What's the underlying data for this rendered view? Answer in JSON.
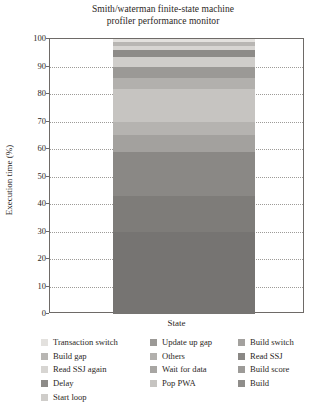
{
  "chart_data": {
    "type": "bar",
    "subtype": "stacked-bar-single-category",
    "title": "Smith/waterman finite-state machine profiler performance monitor",
    "title_lines": [
      "Smith/waterman finite-state machine",
      "profiler performance monitor"
    ],
    "xlabel": "State",
    "ylabel": "Execution time (%)",
    "categories": [
      "State"
    ],
    "ylim": [
      0,
      100
    ],
    "yticks": [
      0,
      10,
      20,
      30,
      40,
      50,
      60,
      70,
      80,
      90,
      100
    ],
    "ytick_labels": [
      "0",
      "10",
      "20",
      "30",
      "40",
      "50",
      "60",
      "70",
      "80",
      "90",
      "100"
    ],
    "grid": "horizontal-dotted",
    "legend_position": "below",
    "legend_columns": 3,
    "stack_order": "top-to-bottom",
    "series": [
      {
        "name": "Transaction switch",
        "value": 1.0,
        "color": "#e3e1de"
      },
      {
        "name": "Build gap",
        "value": 1.5,
        "color": "#b8b6b3"
      },
      {
        "name": "Read SSJ again",
        "value": 1.5,
        "color": "#d7d5d2"
      },
      {
        "name": "Delay",
        "value": 2.5,
        "color": "#8d8b88"
      },
      {
        "name": "Start loop",
        "value": 3.5,
        "color": "#cfcdca"
      },
      {
        "name": "Update up gap",
        "value": 4.0,
        "color": "#9b9996"
      },
      {
        "name": "Others",
        "value": 4.0,
        "color": "#b2b0ad"
      },
      {
        "name": "Wait for data",
        "value": 12.0,
        "color": "#c6c4c1"
      },
      {
        "name": "Pop PWA",
        "value": 5.0,
        "color": "#b5b3b0"
      },
      {
        "name": "Build switch",
        "value": 6.0,
        "color": "#a3a19e"
      },
      {
        "name": "Read SSJ",
        "value": 16.0,
        "color": "#8a8885"
      },
      {
        "name": "Build score",
        "value": 13.0,
        "color": "#7e7c79"
      },
      {
        "name": "Build",
        "value": 30.0,
        "color": "#767472"
      }
    ],
    "legend": {
      "columns": [
        {
          "items": [
            {
              "label": "Transaction switch",
              "color": "#e3e1de"
            },
            {
              "label": "Build gap",
              "color": "#b8b6b3"
            },
            {
              "label": "Read SSJ again",
              "color": "#d7d5d2"
            },
            {
              "label": "Delay",
              "color": "#8d8b88"
            },
            {
              "label": "Start loop",
              "color": "#cfcdca"
            }
          ]
        },
        {
          "items": [
            {
              "label": "Update up gap",
              "color": "#9b9996"
            },
            {
              "label": "Others",
              "color": "#b2b0ad"
            },
            {
              "label": "Wait for data",
              "color": "#a8a6a3"
            },
            {
              "label": "Pop PWA",
              "color": "#c6c4c1"
            }
          ]
        },
        {
          "items": [
            {
              "label": "Build switch",
              "color": "#a3a19e"
            },
            {
              "label": "Read SSJ",
              "color": "#8a8885"
            },
            {
              "label": "Build score",
              "color": "#9d9b98"
            },
            {
              "label": "Build",
              "color": "#8f8d8a"
            }
          ]
        }
      ]
    }
  }
}
